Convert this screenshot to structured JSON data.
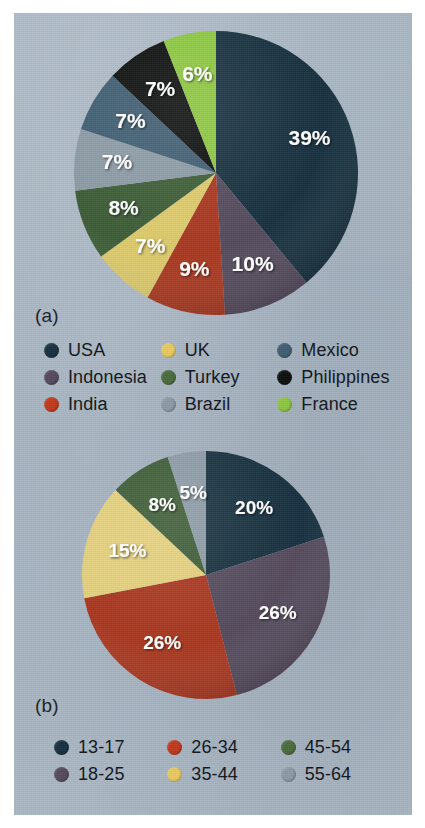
{
  "figure": {
    "background_color": "#ffffff",
    "panel_color": "#a8b6c2"
  },
  "panels": [
    {
      "letter": "(a)",
      "name": "panel-a"
    },
    {
      "letter": "(b)",
      "name": "panel-b"
    }
  ],
  "chart_data": [
    {
      "type": "pie",
      "title": "",
      "panel": "(a)",
      "categories": [
        "USA",
        "Indonesia",
        "India",
        "UK",
        "Turkey",
        "Brazil",
        "Mexico",
        "Philippines",
        "France"
      ],
      "values": [
        39,
        10,
        9,
        7,
        8,
        7,
        7,
        7,
        6
      ],
      "labels": [
        "39%",
        "10%",
        "9%",
        "7%",
        "8%",
        "7%",
        "7%",
        "7%",
        "6%"
      ],
      "colors": [
        "#17303f",
        "#544a5c",
        "#a8371f",
        "#dcc96a",
        "#3d5c36",
        "#8b9aa5",
        "#3f5d72",
        "#0c0f0d",
        "#8cc63f"
      ],
      "legend_position": "bottom",
      "legend_columns": 3,
      "legend_order": [
        "USA",
        "Indonesia",
        "India",
        "UK",
        "Turkey",
        "Brazil",
        "Mexico",
        "Philippines",
        "France"
      ],
      "start_angle_deg": 0,
      "direction": "clockwise",
      "xlabel": "",
      "ylabel": ""
    },
    {
      "type": "pie",
      "title": "",
      "panel": "(b)",
      "categories": [
        "13-17",
        "18-25",
        "26-34",
        "35-44",
        "45-54",
        "55-64"
      ],
      "values": [
        20,
        26,
        26,
        15,
        8,
        5
      ],
      "labels": [
        "20%",
        "26%",
        "26%",
        "15%",
        "8%",
        "5%"
      ],
      "colors": [
        "#17303f",
        "#544a5c",
        "#a8371f",
        "#e3cf7c",
        "#3d5c36",
        "#8b9aa5"
      ],
      "legend_position": "bottom",
      "legend_columns": 3,
      "legend_order": [
        "13-17",
        "18-25",
        "26-34",
        "35-44",
        "45-54",
        "55-64"
      ],
      "start_angle_deg": 0,
      "direction": "clockwise",
      "xlabel": "",
      "ylabel": ""
    }
  ],
  "legends": {
    "a": [
      {
        "label": "USA",
        "color": "#17303f"
      },
      {
        "label": "Indonesia",
        "color": "#544a5c"
      },
      {
        "label": "India",
        "color": "#c0381c"
      },
      {
        "label": "UK",
        "color": "#e7c95e"
      },
      {
        "label": "Turkey",
        "color": "#4a6b3c"
      },
      {
        "label": "Brazil",
        "color": "#8b9aa5"
      },
      {
        "label": "Mexico",
        "color": "#3f5d72"
      },
      {
        "label": "Philippines",
        "color": "#0c0f0d"
      },
      {
        "label": "France",
        "color": "#8cc63f"
      }
    ],
    "b": [
      {
        "label": "13-17",
        "color": "#17303f"
      },
      {
        "label": "18-25",
        "color": "#544a5c"
      },
      {
        "label": "26-34",
        "color": "#c0381c"
      },
      {
        "label": "35-44",
        "color": "#e7c95e"
      },
      {
        "label": "45-54",
        "color": "#4a6b3c"
      },
      {
        "label": "55-64",
        "color": "#8b9aa5"
      }
    ]
  }
}
